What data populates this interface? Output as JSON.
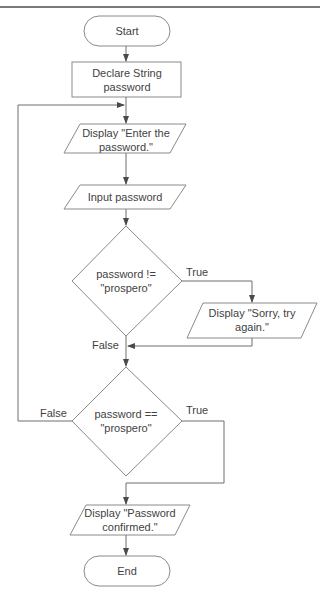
{
  "colors": {
    "stroke": "#8a8a8a",
    "line": "#6e6e6e",
    "text": "#3f3f3f",
    "rule": "#7a7a7a"
  },
  "nodes": {
    "start": {
      "type": "terminal",
      "label": "Start"
    },
    "declare": {
      "type": "process",
      "label": "Declare String password"
    },
    "display_enter": {
      "type": "io",
      "label": "Display \"Enter the password.\""
    },
    "input": {
      "type": "io",
      "label": "Input password"
    },
    "decision_ne": {
      "type": "decision",
      "label": "password != \"prospero\""
    },
    "display_sorry": {
      "type": "io",
      "label": "Display \"Sorry, try again.\""
    },
    "decision_eq": {
      "type": "decision",
      "label": "password == \"prospero\""
    },
    "display_confirmed": {
      "type": "io",
      "label": "Display \"Password confirmed.\""
    },
    "end": {
      "type": "terminal",
      "label": "End"
    }
  },
  "edges": {
    "ne_true": "True",
    "ne_false": "False",
    "eq_true": "True",
    "eq_false": "False"
  }
}
